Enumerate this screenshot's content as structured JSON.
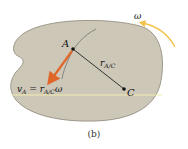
{
  "figure": {
    "caption": "(b)",
    "point_a_label": "A",
    "point_c_label": "C",
    "radius_label_main": "r",
    "radius_label_sub": "A/C",
    "velocity_label_v": "v",
    "velocity_label_v_sub": "A",
    "velocity_label_eq": " = ",
    "velocity_label_r": "r",
    "velocity_label_r_sub": "A/C",
    "velocity_label_omega": "ω",
    "angular_velocity_label": "ω"
  },
  "colors": {
    "body_fill": "#cdc7b8",
    "body_stroke": "#8a8476",
    "velocity_arrow": "#e0672a",
    "omega_arrow": "#f2c24a",
    "reference_line": "#f1ecb0",
    "radius_line": "#222222",
    "path_curve": "#555555"
  }
}
